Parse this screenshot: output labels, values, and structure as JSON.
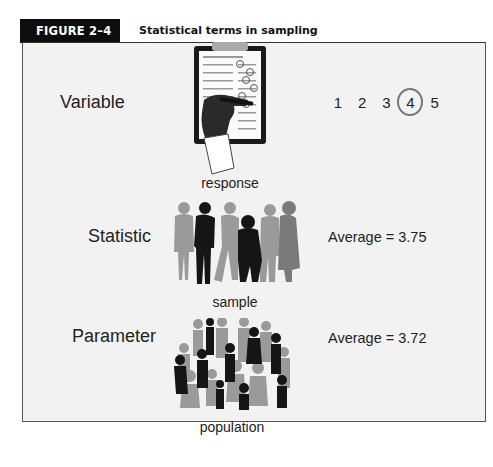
{
  "figure": {
    "tag": "FIGURE 2–4",
    "title": "Statistical terms in sampling"
  },
  "rows": [
    {
      "term": "Variable",
      "caption": "response",
      "illustration": "clipboard-survey-icon",
      "scale": [
        "1",
        "2",
        "3",
        "4",
        "5"
      ],
      "selected": "4"
    },
    {
      "term": "Statistic",
      "caption": "sample",
      "illustration": "small-group-people-icon",
      "value": "Average = 3.75"
    },
    {
      "term": "Parameter",
      "caption": "population",
      "illustration": "large-crowd-people-icon",
      "value": "Average = 3.72"
    }
  ],
  "colors": {
    "tag_bg": "#0d0d0d",
    "panel_bg": "#f2f2f2",
    "dark_figure": "#151515",
    "light_figure": "#9a9a9a",
    "circle": "#777777"
  }
}
